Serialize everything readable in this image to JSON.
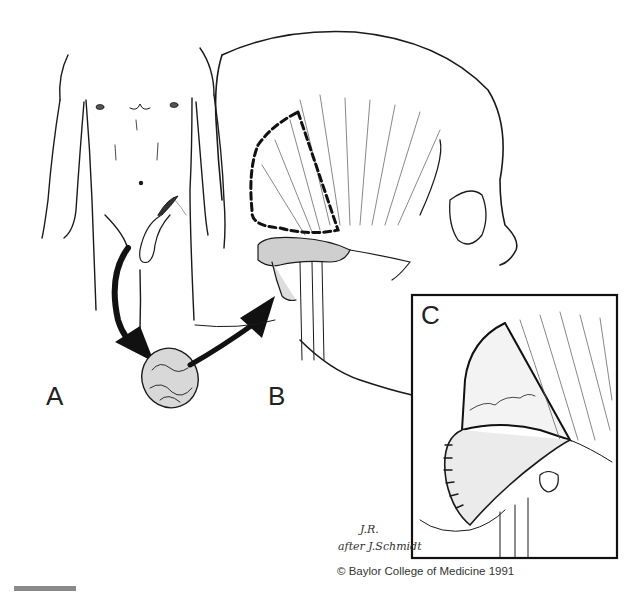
{
  "figure": {
    "panels": [
      {
        "id": "A",
        "label": "A",
        "content": "Anterior male torso with harvest site near left groin/abdomen"
      },
      {
        "id": "B",
        "label": "B",
        "content": "Lateral skull with temporalis muscle outlined by dashed line and transferred tissue at skull base"
      },
      {
        "id": "C",
        "label": "C",
        "content": "Inset: sutured muscle flap rotated over defect"
      }
    ],
    "arrows": [
      {
        "from": "abdomen",
        "to": "tissue-graft",
        "label": ""
      },
      {
        "from": "tissue-graft",
        "to": "skull-base",
        "label": ""
      }
    ],
    "signature": {
      "line1": "J.R.",
      "line2": "after J.Schmidt"
    },
    "copyright": "© Baylor College of Medicine 1991",
    "colors": {
      "ink": "#1a1a1a",
      "shade": "#c8c8c8",
      "scale_bar": "#8a8a8a",
      "background": "#ffffff"
    }
  }
}
